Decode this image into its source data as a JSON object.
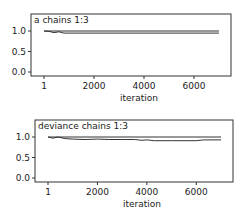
{
  "chart_data": [
    {
      "type": "line",
      "title": "a chains 1:3",
      "xlabel": "iteration",
      "ylabel": "",
      "xlim": [
        1,
        7000
      ],
      "ylim": [
        0.0,
        1.0
      ],
      "xticks": [
        "1",
        "2000",
        "4000",
        "6000"
      ],
      "yticks": [
        "0.0",
        "0.5",
        "1.0"
      ],
      "grid": false,
      "series": [
        {
          "name": "upper",
          "x": [
            1,
            7000
          ],
          "values": [
            1.0,
            1.0
          ]
        },
        {
          "name": "lower",
          "x": [
            1,
            200,
            400,
            600,
            800,
            1000,
            7000
          ],
          "values": [
            1.0,
            0.99,
            0.96,
            0.98,
            0.95,
            0.95,
            0.95
          ]
        }
      ]
    },
    {
      "type": "line",
      "title": "deviance chains 1:3",
      "xlabel": "iteration",
      "ylabel": "",
      "xlim": [
        1,
        7000
      ],
      "ylim": [
        0.0,
        1.0
      ],
      "xticks": [
        "1",
        "2000",
        "4000",
        "6000"
      ],
      "yticks": [
        "0.0",
        "0.5",
        "1.0"
      ],
      "grid": false,
      "series": [
        {
          "name": "upper",
          "x": [
            1,
            7000
          ],
          "values": [
            1.0,
            1.0
          ]
        },
        {
          "name": "lower",
          "x": [
            1,
            200,
            400,
            700,
            1000,
            1500,
            2000,
            2500,
            3000,
            3500,
            3800,
            4000,
            4300,
            5000,
            6000,
            6300,
            7000
          ],
          "values": [
            1.0,
            0.97,
            1.0,
            0.96,
            0.95,
            0.94,
            0.95,
            0.94,
            0.94,
            0.94,
            0.92,
            0.93,
            0.91,
            0.91,
            0.91,
            0.93,
            0.93
          ]
        }
      ]
    }
  ],
  "panels": [
    {
      "title": "a chains 1:3",
      "xlabel": "iteration"
    },
    {
      "title": "deviance chains 1:3",
      "xlabel": "iteration"
    }
  ]
}
